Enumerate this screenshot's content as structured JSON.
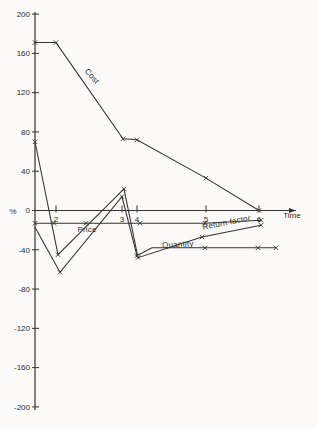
{
  "figure": {
    "background": "#fbfaf8",
    "ink": "#35322f",
    "marker_glyph": "x"
  },
  "chart_data": {
    "type": "line",
    "title": "",
    "xlabel": "Time",
    "ylabel": "%",
    "ylim": [
      -200,
      200
    ],
    "grid": false,
    "legend_position": "inline-labels",
    "axis_px": {
      "x_origin": 35,
      "y_zero": 210.5,
      "y_scale": 0.982,
      "y_top": 12,
      "y_bottom": 410,
      "x_end": 296
    },
    "y_ticks": [
      {
        "label": "200",
        "value": 200
      },
      {
        "label": "160",
        "value": 160
      },
      {
        "label": "120",
        "value": 120
      },
      {
        "label": "80",
        "value": 80
      },
      {
        "label": "40",
        "value": 40
      },
      {
        "label": "0",
        "value": 0
      },
      {
        "label": "-40",
        "value": -40
      },
      {
        "label": "-80",
        "value": -80
      },
      {
        "label": "-120",
        "value": -120
      },
      {
        "label": "-160",
        "value": -160
      },
      {
        "label": "-200",
        "value": -200
      }
    ],
    "x_ticks": [
      {
        "label": "2",
        "px": 56
      },
      {
        "label": "3",
        "px": 122
      },
      {
        "label": "4",
        "px": 137
      },
      {
        "label": "5",
        "px": 206
      },
      {
        "label": "6",
        "px": 259
      }
    ],
    "series": [
      {
        "name": "Cost",
        "times": [
          1,
          2,
          3,
          4,
          5,
          6
        ],
        "values": [
          171,
          171,
          73,
          72,
          33,
          0
        ],
        "path_px": [
          [
            35,
            171
          ],
          [
            56,
            171
          ],
          [
            123,
            73
          ],
          [
            137,
            72
          ],
          [
            206,
            33
          ],
          [
            259,
            0
          ]
        ],
        "markers_px": [
          [
            35,
            171
          ],
          [
            56,
            171
          ],
          [
            123,
            73
          ],
          [
            137,
            72
          ],
          [
            206,
            33
          ],
          [
            259,
            0
          ]
        ],
        "label": {
          "text": "Cost",
          "x": 90,
          "y": 78,
          "rotate": 48
        }
      },
      {
        "name": "Price",
        "times": [
          1,
          2,
          3,
          4,
          5,
          6
        ],
        "values": [
          -13,
          -13,
          -13,
          -13,
          -13,
          -10
        ],
        "path_px": [
          [
            35,
            -13
          ],
          [
            205,
            -13
          ],
          [
            261,
            -10
          ]
        ],
        "markers_px": [
          [
            35,
            -13
          ],
          [
            54,
            -13
          ],
          [
            86,
            -13
          ],
          [
            140,
            -13
          ],
          [
            205,
            -13
          ],
          [
            261,
            -10
          ]
        ],
        "label": {
          "text": "Price",
          "x": 87,
          "y": 232,
          "rotate": 0
        }
      },
      {
        "name": "Quantity",
        "times": [
          1,
          2,
          3,
          4,
          5,
          6
        ],
        "values": [
          -17,
          -63,
          14,
          -46,
          -38,
          -38
        ],
        "path_px": [
          [
            35,
            -17
          ],
          [
            60,
            -63
          ],
          [
            122,
            14
          ],
          [
            137,
            -46
          ],
          [
            152,
            -38
          ],
          [
            276,
            -38
          ]
        ],
        "markers_px": [
          [
            60,
            -63
          ],
          [
            122,
            14
          ],
          [
            137,
            -46
          ],
          [
            205,
            -38
          ],
          [
            258,
            -38
          ],
          [
            276,
            -38
          ]
        ],
        "label": {
          "text": "Quantity",
          "x": 178,
          "y": 247,
          "rotate": -3
        }
      },
      {
        "name": "Return factor",
        "times": [
          1,
          2,
          3,
          4,
          5,
          6
        ],
        "values": [
          70,
          -45,
          22,
          -48,
          -27,
          -15
        ],
        "path_px": [
          [
            35,
            70
          ],
          [
            58,
            -45
          ],
          [
            124,
            22
          ],
          [
            138,
            -48
          ],
          [
            202,
            -27
          ],
          [
            261,
            -15
          ]
        ],
        "markers_px": [
          [
            35,
            70
          ],
          [
            58,
            -45
          ],
          [
            124,
            22
          ],
          [
            138,
            -48
          ],
          [
            202,
            -27
          ],
          [
            261,
            -15
          ]
        ],
        "label": {
          "text": "Return factor",
          "x": 227,
          "y": 225,
          "rotate": -11
        }
      }
    ]
  }
}
